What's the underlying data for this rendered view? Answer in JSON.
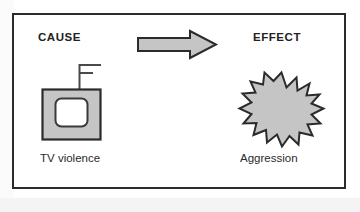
{
  "diagram": {
    "title_cause": "CAUSE",
    "title_effect": "EFFECT",
    "caption_cause": "TV violence",
    "caption_effect": "Aggression",
    "arrow": {
      "icon": "right-block-arrow-icon",
      "direction": "right"
    },
    "cause_graphic": {
      "icon": "television-icon",
      "parts": [
        "antenna",
        "cabinet",
        "screen"
      ]
    },
    "effect_graphic": {
      "icon": "starburst-icon"
    },
    "colors": {
      "fill_gray": "#c5c5c5",
      "outline_dark": "#2b2b2b",
      "screen_white": "#ffffff",
      "frame_border": "#2b2b2b",
      "text": "#222222",
      "background": "#ffffff"
    }
  }
}
